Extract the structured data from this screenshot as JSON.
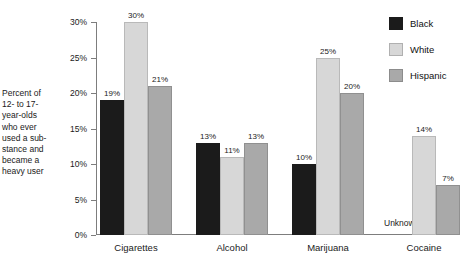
{
  "chart_data": {
    "type": "bar",
    "title": "",
    "subtitle": "",
    "xlabel": "",
    "ylabel": "Percent of\n12- to 17-\nyear-olds\nwho ever\nused a sub-\nstance and\nbecame a\nheavy user",
    "categories": [
      "Cigarettes",
      "Alcohol",
      "Marijuana",
      "Cocaine"
    ],
    "series": [
      {
        "name": "Black",
        "color": "#1b1b1b",
        "values": [
          19,
          13,
          10,
          null
        ],
        "labels": [
          "19%",
          "13%",
          "10%",
          "Unknown"
        ]
      },
      {
        "name": "White",
        "color": "#d7d7d7",
        "values": [
          30,
          11,
          25,
          14
        ],
        "labels": [
          "30%",
          "11%",
          "25%",
          "14%"
        ]
      },
      {
        "name": "Hispanic",
        "color": "#a9a9a9",
        "values": [
          21,
          13,
          20,
          7
        ],
        "labels": [
          "21%",
          "13%",
          "20%",
          "7%"
        ]
      }
    ],
    "ylim": [
      0,
      30
    ],
    "ytick_values": [
      0,
      5,
      10,
      15,
      20,
      25,
      30
    ],
    "ytick_labels": [
      "0%",
      "5%",
      "10%",
      "15%",
      "20%",
      "25%",
      "30%"
    ],
    "grid": false,
    "legend_position": "top-right",
    "missing_label": "Unknown"
  },
  "legend": {
    "items": [
      {
        "label": "Black",
        "swatch": "s-black"
      },
      {
        "label": "White",
        "swatch": "s-white"
      },
      {
        "label": "Hispanic",
        "swatch": "s-hisp"
      }
    ]
  }
}
